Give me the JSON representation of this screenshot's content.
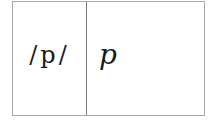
{
  "table": {
    "rows": [
      {
        "phoneme": "/p/",
        "letter": "p"
      }
    ]
  }
}
